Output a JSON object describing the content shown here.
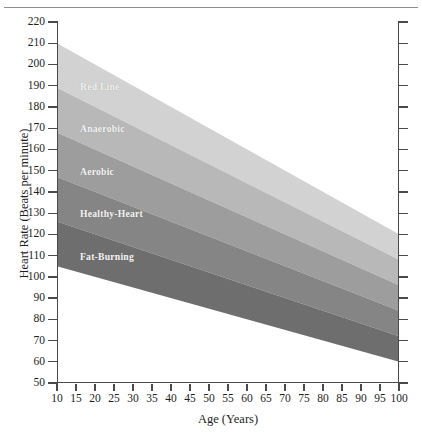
{
  "chart_data": {
    "type": "area",
    "title": "",
    "xlabel": "Age (Years)",
    "ylabel": "Heart Rate (Beats per minute)",
    "xlim": [
      10,
      100
    ],
    "ylim": [
      50,
      220
    ],
    "grid": false,
    "legend_position": "inline-band-labels",
    "x_ticks": [
      10,
      15,
      20,
      25,
      30,
      35,
      40,
      45,
      50,
      55,
      60,
      65,
      70,
      75,
      80,
      85,
      90,
      95,
      100
    ],
    "y_ticks": [
      50,
      60,
      70,
      80,
      90,
      100,
      110,
      120,
      130,
      140,
      150,
      160,
      170,
      180,
      190,
      200,
      210,
      220
    ],
    "x": [
      10,
      100
    ],
    "series": [
      {
        "name": "Red Line",
        "color": "#d2d2d2",
        "upper": [
          210,
          120
        ],
        "lower": [
          189,
          108
        ],
        "label_text": "Red Line"
      },
      {
        "name": "Anaerobic",
        "color": "#b8b8b8",
        "upper": [
          189,
          108
        ],
        "lower": [
          168,
          96
        ],
        "label_text": "Anaerobic"
      },
      {
        "name": "Aerobic",
        "color": "#9d9d9d",
        "upper": [
          168,
          96
        ],
        "lower": [
          147,
          84
        ],
        "label_text": "Aerobic"
      },
      {
        "name": "Healthy-Heart",
        "color": "#858585",
        "upper": [
          147,
          84
        ],
        "lower": [
          126,
          72
        ],
        "label_text": "Healthy-Heart"
      },
      {
        "name": "Fat-Burning",
        "color": "#6e6e6e",
        "upper": [
          126,
          72
        ],
        "lower": [
          105,
          60
        ],
        "label_text": "Fat-Burning"
      }
    ],
    "annotations": [
      {
        "text": "Red Line",
        "x": 15,
        "y": 190
      },
      {
        "text": "Anaerobic",
        "x": 15,
        "y": 170
      },
      {
        "text": "Aerobic",
        "x": 15,
        "y": 150
      },
      {
        "text": "Healthy-Heart",
        "x": 15,
        "y": 130
      },
      {
        "text": "Fat-Burning",
        "x": 15,
        "y": 110
      }
    ]
  },
  "axes": {
    "y_tick_labels": [
      "220",
      "210",
      "200",
      "190",
      "180",
      "170",
      "160",
      "150",
      "140",
      "130",
      "120",
      "110",
      "100",
      "90",
      "80",
      "70",
      "60",
      "50"
    ],
    "x_tick_labels": [
      "10",
      "15",
      "20",
      "25",
      "30",
      "35",
      "40",
      "45",
      "50",
      "55",
      "60",
      "65",
      "70",
      "75",
      "80",
      "85",
      "90",
      "95",
      "100"
    ],
    "y_axis_title": "Heart Rate (Beats per minute)",
    "x_axis_title": "Age (Years)"
  },
  "band_labels": {
    "red_line": "Red Line",
    "anaerobic": "Anaerobic",
    "aerobic": "Aerobic",
    "healthy_heart": "Healthy-Heart",
    "fat_burning": "Fat-Burning"
  },
  "colors": {
    "band_red_line": "#d2d2d2",
    "band_anaerobic": "#b8b8b8",
    "band_aerobic": "#9d9d9d",
    "band_healthy_heart": "#858585",
    "band_fat_burning": "#6e6e6e",
    "axis": "#4a4a4a",
    "text": "#1d1d1d",
    "band_label_text": "#f4f4f4",
    "background": "#ffffff",
    "top_rule": "#8d8d8d"
  }
}
